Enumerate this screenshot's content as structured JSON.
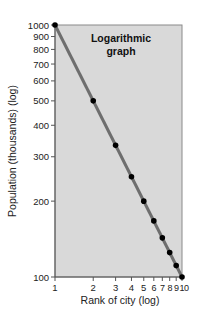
{
  "chart_data": {
    "type": "line",
    "title": "",
    "annotation": [
      "Logarithmic",
      "graph"
    ],
    "xlabel": "Rank of city (log)",
    "ylabel": "Population (thousands) (log)",
    "xscale": "log",
    "yscale": "log",
    "xlim": [
      1,
      10
    ],
    "ylim": [
      100,
      1000
    ],
    "grid": false,
    "legend": null,
    "x_ticks": [
      1,
      2,
      3,
      4,
      5,
      6,
      7,
      8,
      9,
      10
    ],
    "x_tick_labels": [
      "1",
      "2",
      "3",
      "4",
      "5",
      "6",
      "7",
      "8",
      "9",
      "10"
    ],
    "y_ticks": [
      100,
      200,
      300,
      400,
      500,
      600,
      700,
      800,
      900,
      1000
    ],
    "y_tick_labels": [
      "100",
      "200",
      "300",
      "400",
      "500",
      "600",
      "700",
      "800",
      "900",
      "1000"
    ],
    "series": [
      {
        "name": "City population by rank",
        "x": [
          1,
          2,
          3,
          4,
          5,
          6,
          7,
          8,
          9,
          10
        ],
        "values": [
          1000,
          500,
          333,
          250,
          200,
          167,
          143,
          125,
          111,
          100
        ]
      }
    ],
    "colors": {
      "plot_background": "#d9d9d9",
      "frame": "#8a8a8a",
      "line": "#6e6e6e",
      "marker": "#000000"
    }
  }
}
